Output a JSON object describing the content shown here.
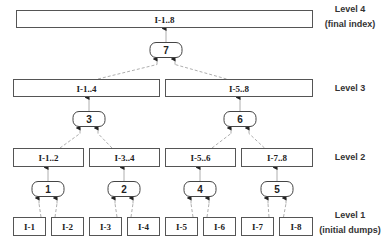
{
  "diagram": {
    "levels": [
      {
        "id": "level4",
        "label": "Level 4",
        "sublabel": "(final index)",
        "y": 18
      },
      {
        "id": "level3",
        "label": "Level 3",
        "sublabel": "",
        "y": 88
      },
      {
        "id": "level2",
        "label": "Level 2",
        "sublabel": "",
        "y": 157
      },
      {
        "id": "level1",
        "label": "Level 1",
        "sublabel": "(initial dumps)",
        "y": 224
      }
    ],
    "boxes": [
      {
        "id": "I-1..8",
        "label": "I-1..8",
        "x": 16,
        "y": 10,
        "w": 296,
        "h": 17,
        "level": 4
      },
      {
        "id": "I-1..4",
        "label": "I-1..4",
        "x": 13,
        "y": 79,
        "w": 146,
        "h": 17,
        "level": 3
      },
      {
        "id": "I-5..8",
        "label": "I-5..8",
        "x": 165,
        "y": 79,
        "w": 147,
        "h": 17,
        "level": 3
      },
      {
        "id": "I-1..2",
        "label": "I-1..2",
        "x": 13,
        "y": 148,
        "w": 70,
        "h": 18,
        "level": 2
      },
      {
        "id": "I-3..4",
        "label": "I-3..4",
        "x": 89,
        "y": 148,
        "w": 70,
        "h": 18,
        "level": 2
      },
      {
        "id": "I-5..6",
        "label": "I-5..6",
        "x": 165,
        "y": 148,
        "w": 70,
        "h": 18,
        "level": 2
      },
      {
        "id": "I-7..8",
        "label": "I-7..8",
        "x": 241,
        "y": 148,
        "w": 71,
        "h": 18,
        "level": 2
      },
      {
        "id": "I-1",
        "label": "I-1",
        "x": 13,
        "y": 217,
        "w": 32,
        "h": 18,
        "level": 1
      },
      {
        "id": "I-2",
        "label": "I-2",
        "x": 51,
        "y": 217,
        "w": 32,
        "h": 18,
        "level": 1
      },
      {
        "id": "I-3",
        "label": "I-3",
        "x": 89,
        "y": 217,
        "w": 32,
        "h": 18,
        "level": 1
      },
      {
        "id": "I-4",
        "label": "I-4",
        "x": 127,
        "y": 217,
        "w": 32,
        "h": 18,
        "level": 1
      },
      {
        "id": "I-5",
        "label": "I-5",
        "x": 165,
        "y": 217,
        "w": 32,
        "h": 18,
        "level": 1
      },
      {
        "id": "I-6",
        "label": "I-6",
        "x": 203,
        "y": 217,
        "w": 32,
        "h": 18,
        "level": 1
      },
      {
        "id": "I-7",
        "label": "I-7",
        "x": 241,
        "y": 217,
        "w": 32,
        "h": 18,
        "level": 1
      },
      {
        "id": "I-8",
        "label": "I-8",
        "x": 279,
        "y": 217,
        "w": 33,
        "h": 18,
        "level": 1
      }
    ],
    "merge_nodes": [
      {
        "label": "1",
        "cx": 48,
        "cy": 189,
        "inputs": [
          "I-1",
          "I-2"
        ],
        "output": "I-1..2"
      },
      {
        "label": "2",
        "cx": 124,
        "cy": 189,
        "inputs": [
          "I-3",
          "I-4"
        ],
        "output": "I-3..4"
      },
      {
        "label": "4",
        "cx": 200,
        "cy": 189,
        "inputs": [
          "I-5",
          "I-6"
        ],
        "output": "I-5..6"
      },
      {
        "label": "5",
        "cx": 277,
        "cy": 189,
        "inputs": [
          "I-7",
          "I-8"
        ],
        "output": "I-7..8"
      },
      {
        "label": "3",
        "cx": 89,
        "cy": 119,
        "inputs": [
          "I-1..2",
          "I-3..4"
        ],
        "output": "I-1..4"
      },
      {
        "label": "6",
        "cx": 240,
        "cy": 119,
        "inputs": [
          "I-5..6",
          "I-7..8"
        ],
        "output": "I-5..8"
      },
      {
        "label": "7",
        "cx": 166,
        "cy": 50,
        "inputs": [
          "I-1..4",
          "I-5..8"
        ],
        "output": "I-1..8"
      }
    ],
    "colors": {
      "box_stroke": "#555555",
      "edge": "#999999",
      "text": "#222222"
    }
  }
}
